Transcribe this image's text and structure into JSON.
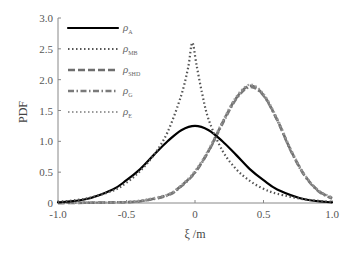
{
  "chart_data": {
    "type": "line",
    "title": "",
    "xlabel": "ξ /m",
    "ylabel": "PDF",
    "xlim": [
      -1.0,
      1.0
    ],
    "ylim": [
      0,
      3.0
    ],
    "xticks": [
      "-1.0",
      "-0.5",
      "0",
      "0.5",
      "1.0"
    ],
    "yticks": [
      "0",
      "0.5",
      "1.0",
      "1.5",
      "2.0",
      "2.5",
      "3.0"
    ],
    "grid": false,
    "legend_position": "upper-left",
    "series": [
      {
        "name": "ρA",
        "base": "ρ",
        "sub": "A",
        "style": "solid",
        "color": "#000000",
        "x": [
          -1.0,
          -0.8,
          -0.6,
          -0.5,
          -0.4,
          -0.3,
          -0.2,
          -0.1,
          0.0,
          0.1,
          0.2,
          0.3,
          0.4,
          0.5,
          0.6,
          0.8,
          1.0
        ],
        "y": [
          0.01,
          0.06,
          0.22,
          0.37,
          0.55,
          0.78,
          1.0,
          1.18,
          1.25,
          1.18,
          1.0,
          0.78,
          0.55,
          0.37,
          0.22,
          0.06,
          0.01
        ]
      },
      {
        "name": "ρMB",
        "base": "ρ",
        "sub": "MB",
        "style": "dotted",
        "color": "#555555",
        "x": [
          -1.0,
          -0.8,
          -0.6,
          -0.5,
          -0.4,
          -0.3,
          -0.2,
          -0.1,
          -0.05,
          -0.02,
          0.01,
          0.05,
          0.1,
          0.2,
          0.3,
          0.4,
          0.5,
          0.6,
          0.8,
          1.0
        ],
        "y": [
          0.02,
          0.07,
          0.2,
          0.33,
          0.52,
          0.78,
          1.15,
          1.75,
          2.2,
          2.6,
          2.25,
          1.8,
          1.35,
          0.85,
          0.55,
          0.36,
          0.23,
          0.15,
          0.06,
          0.02
        ]
      },
      {
        "name": "ρSHD",
        "base": "ρ",
        "sub": "SHD",
        "style": "dashed",
        "color": "#6e6e6e",
        "x": [
          -1.0,
          -0.6,
          -0.4,
          -0.2,
          -0.1,
          0.0,
          0.1,
          0.2,
          0.3,
          0.4,
          0.5,
          0.6,
          0.7,
          0.8,
          0.9,
          1.0
        ],
        "y": [
          0.0,
          0.01,
          0.03,
          0.13,
          0.28,
          0.5,
          0.85,
          1.3,
          1.7,
          1.9,
          1.75,
          1.35,
          0.85,
          0.45,
          0.2,
          0.08
        ]
      },
      {
        "name": "ρG",
        "base": "ρ",
        "sub": "G",
        "style": "dash-dot",
        "color": "#7a7a7a",
        "x": [
          -1.0,
          -0.6,
          -0.4,
          -0.2,
          -0.1,
          0.0,
          0.1,
          0.2,
          0.3,
          0.4,
          0.5,
          0.6,
          0.7,
          0.8,
          0.9,
          1.0
        ],
        "y": [
          0.0,
          0.01,
          0.03,
          0.12,
          0.27,
          0.49,
          0.84,
          1.28,
          1.68,
          1.88,
          1.74,
          1.34,
          0.84,
          0.44,
          0.19,
          0.07
        ]
      },
      {
        "name": "ρE",
        "base": "ρ",
        "sub": "E",
        "style": "dotted",
        "color": "#9a9a9a",
        "x": [
          -1.0,
          -0.6,
          -0.4,
          -0.2,
          -0.1,
          0.0,
          0.1,
          0.2,
          0.3,
          0.4,
          0.5,
          0.6,
          0.7,
          0.8,
          0.9,
          1.0
        ],
        "y": [
          0.0,
          0.01,
          0.04,
          0.14,
          0.29,
          0.52,
          0.87,
          1.32,
          1.72,
          1.92,
          1.77,
          1.37,
          0.87,
          0.46,
          0.21,
          0.09
        ]
      }
    ]
  }
}
